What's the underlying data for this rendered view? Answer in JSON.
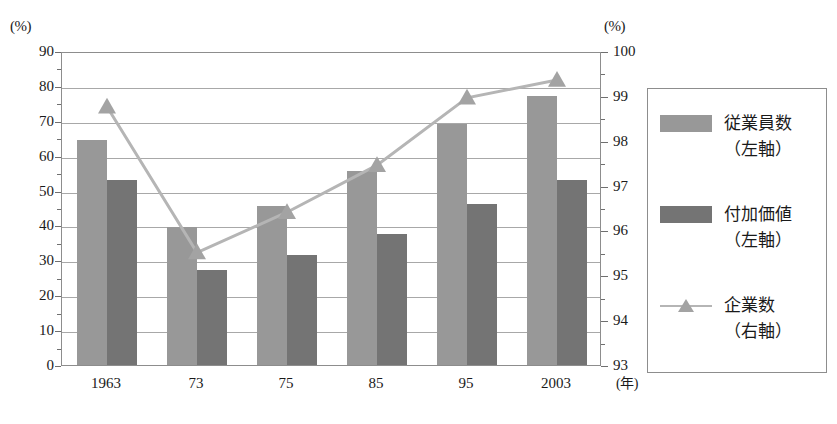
{
  "chart_data": {
    "type": "bar",
    "title": "",
    "subtitle": "",
    "categories": [
      "1963",
      "73",
      "75",
      "85",
      "95",
      "2003"
    ],
    "xlabel": "(年)",
    "left_axis": {
      "unit": "(%)",
      "label": "(%)",
      "ylim": [
        0,
        90
      ],
      "ticks": [
        0,
        10,
        20,
        30,
        40,
        50,
        60,
        70,
        80,
        90
      ],
      "tick_labels": [
        "0",
        "10",
        "20",
        "30",
        "40",
        "50",
        "60",
        "70",
        "80",
        "90"
      ],
      "minor_step": 5
    },
    "right_axis": {
      "unit": "(%)",
      "label": "(%)",
      "ylim": [
        93,
        100
      ],
      "ticks": [
        93,
        94,
        95,
        96,
        97,
        98,
        99,
        100
      ],
      "tick_labels": [
        "93",
        "94",
        "95",
        "96",
        "97",
        "98",
        "99",
        "100"
      ],
      "minor_step": 0.5
    },
    "grid": true,
    "legend_position": "right",
    "series": [
      {
        "name": "従業員数",
        "sub": "（左軸）",
        "kind": "bar",
        "axis": "left",
        "color": "#989898",
        "values": [
          64.4,
          39.6,
          45.6,
          55.7,
          69.2,
          77.1
        ]
      },
      {
        "name": "付加価値",
        "sub": "（左軸）",
        "kind": "bar",
        "axis": "left",
        "color": "#747474",
        "values": [
          53.1,
          27.2,
          31.5,
          37.5,
          46.1,
          52.9
        ]
      },
      {
        "name": "企業数",
        "sub": "（右軸）",
        "kind": "line",
        "axis": "right",
        "color": "#b5b5b5",
        "marker": "triangle",
        "marker_color": "#a3a3a3",
        "values": [
          98.8,
          95.55,
          96.45,
          97.5,
          99.0,
          99.4
        ]
      }
    ]
  },
  "legend": {
    "items": [
      {
        "label": "従業員数",
        "sub": "（左軸）",
        "swatch": "emp"
      },
      {
        "label": "付加価値",
        "sub": "（左軸）",
        "swatch": "val"
      },
      {
        "label": "企業数",
        "sub": "（右軸）",
        "swatch": "line"
      }
    ]
  },
  "colors": {
    "employees_bar": "#989898",
    "value_added_bar": "#747474",
    "firms_line": "#b5b5b5",
    "axis": "#8d8d8d",
    "grid": "#a8a8a8"
  }
}
